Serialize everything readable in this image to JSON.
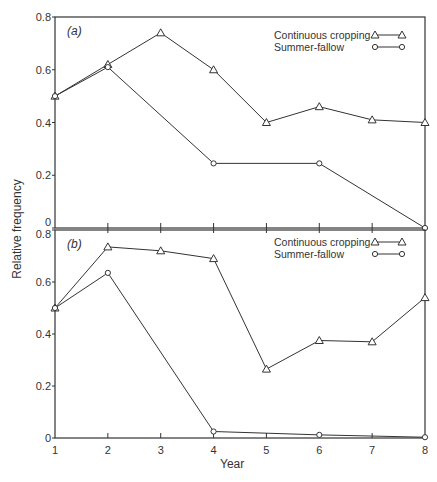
{
  "chart_data": [
    {
      "type": "line",
      "panel_label": "(a)",
      "title": "",
      "xlabel": "Year",
      "ylabel": "Relative frequency",
      "x": [
        1,
        2,
        3,
        4,
        5,
        6,
        7,
        8
      ],
      "ylim": [
        0,
        0.8
      ],
      "yticks": [
        "0",
        "0.2",
        "0.4",
        "0.6",
        "0.8"
      ],
      "legend_position": "upper right",
      "grid": false,
      "series": [
        {
          "name": "Continuous cropping",
          "marker": "triangle",
          "x": [
            1,
            2,
            3,
            4,
            5,
            6,
            7,
            8
          ],
          "values": [
            0.5,
            0.62,
            0.74,
            0.6,
            0.4,
            0.46,
            0.41,
            0.4
          ]
        },
        {
          "name": "Summer-fallow",
          "marker": "circle",
          "x": [
            1,
            2,
            4,
            6,
            8
          ],
          "values": [
            0.5,
            0.61,
            0.245,
            0.245,
            0.0
          ]
        }
      ]
    },
    {
      "type": "line",
      "panel_label": "(b)",
      "title": "",
      "xlabel": "Year",
      "ylabel": "Relative frequency",
      "x": [
        1,
        2,
        3,
        4,
        5,
        6,
        7,
        8
      ],
      "xticks": [
        "1",
        "2",
        "3",
        "4",
        "5",
        "6",
        "7",
        "8"
      ],
      "ylim": [
        0,
        0.8
      ],
      "yticks": [
        "0",
        "0.2",
        "0.4",
        "0.6",
        "0.8"
      ],
      "legend_position": "upper right",
      "grid": false,
      "series": [
        {
          "name": "Continuous cropping",
          "marker": "triangle",
          "x": [
            1,
            2,
            3,
            4,
            5,
            6,
            7,
            8
          ],
          "values": [
            0.5,
            0.735,
            0.72,
            0.69,
            0.265,
            0.375,
            0.37,
            0.54
          ]
        },
        {
          "name": "Summer-fallow",
          "marker": "circle",
          "x": [
            1,
            2,
            4,
            6,
            8
          ],
          "values": [
            0.5,
            0.635,
            0.025,
            0.012,
            0.003
          ]
        }
      ]
    }
  ],
  "labels": {
    "ylabel": "Relative frequency",
    "xlabel": "Year"
  },
  "style": {
    "line_color": "#333333",
    "frame_color": "#333333"
  }
}
